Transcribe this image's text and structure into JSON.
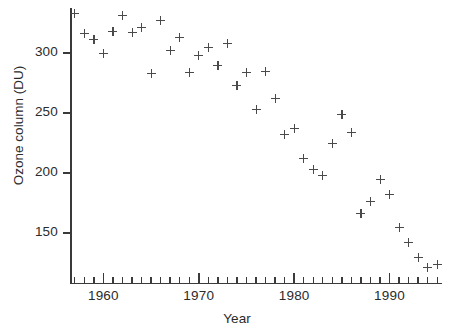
{
  "chart_data": {
    "type": "scatter",
    "title": "",
    "xlabel": "Year",
    "ylabel": "Ozone column (DU)",
    "xlim": [
      1956.5,
      1995.5
    ],
    "ylim": [
      112,
      340
    ],
    "grid": false,
    "legend": null,
    "marker": "plus",
    "marker_color": "#4a4a4a",
    "axis_color": "#3a3a3a",
    "background": "#ffffff",
    "x_major_ticks": [
      1960,
      1970,
      1980,
      1990
    ],
    "x_major_tick_labels": [
      "1960",
      "1970",
      "1980",
      "1990"
    ],
    "x_minor_tick_step": 1,
    "y_ticks": [
      150,
      200,
      250,
      300
    ],
    "y_tick_labels": [
      "150",
      "200",
      "250",
      "300"
    ],
    "x": [
      1957,
      1958,
      1959,
      1960,
      1961,
      1962,
      1963,
      1964,
      1965,
      1966,
      1967,
      1968,
      1969,
      1970,
      1971,
      1972,
      1973,
      1974,
      1975,
      1976,
      1977,
      1978,
      1979,
      1980,
      1981,
      1982,
      1983,
      1984,
      1985,
      1986,
      1987,
      1988,
      1989,
      1990,
      1991,
      1992,
      1993,
      1994,
      1995
    ],
    "y": [
      333,
      316,
      311,
      300,
      318,
      331,
      317,
      321,
      283,
      327,
      302,
      313,
      284,
      298,
      305,
      290,
      308,
      273,
      284,
      253,
      285,
      262,
      232,
      237,
      212,
      203,
      198,
      225,
      249,
      234,
      166,
      176,
      195,
      182,
      155,
      142,
      130,
      121,
      124
    ],
    "series_name": "Antarctic ozone column"
  }
}
